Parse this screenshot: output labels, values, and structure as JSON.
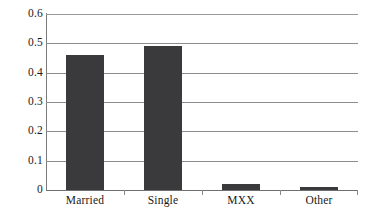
{
  "chart_data": {
    "type": "bar",
    "title": "",
    "subtitle": "",
    "xlabel": "",
    "ylabel": "",
    "categories": [
      "Married",
      "Single",
      "MXX",
      "Other"
    ],
    "values": [
      0.46,
      0.49,
      0.02,
      0.01
    ],
    "series": [
      {
        "name": "",
        "values": [
          0.46,
          0.49,
          0.02,
          0.01
        ]
      }
    ],
    "ylim": [
      0,
      0.6
    ],
    "ytick_labels": [
      "0.6",
      "0.5",
      "0.4",
      "0.3",
      "0.2",
      "0.1",
      "0"
    ],
    "ytick_values": [
      0.6,
      0.5,
      0.4,
      0.3,
      0.2,
      0.1,
      0
    ],
    "grid": "horizontal",
    "legend": "none",
    "annotations": [],
    "colors": {
      "bar_fill": "#3a3a3c",
      "gridline": "#8d8d8d",
      "axis_line": "#7a7a7a",
      "text": "#1a1a1a",
      "background": "#ffffff"
    }
  }
}
